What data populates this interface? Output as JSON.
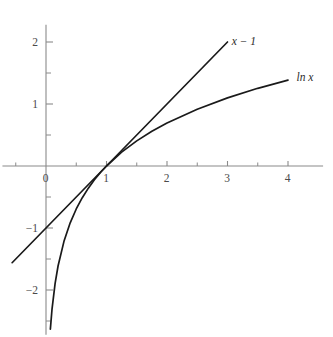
{
  "chart_data": {
    "type": "line",
    "title": "",
    "subtitle": "",
    "xlabel": "",
    "ylabel": "",
    "xlim": [
      -0.75,
      4.6
    ],
    "ylim": [
      -2.7,
      2.35
    ],
    "grid": false,
    "legend_position": "inline-curve-end-labels",
    "x_ticks_major": [
      0,
      1,
      2,
      3,
      4
    ],
    "x_tick_labels": [
      "0",
      "1",
      "2",
      "3",
      "4"
    ],
    "x_ticks_minor": [
      -0.5,
      0.5,
      1.5,
      2.5,
      3.5
    ],
    "y_ticks_major": [
      -2,
      -1,
      1,
      2
    ],
    "y_tick_labels": [
      "−2",
      "−1",
      "1",
      "2"
    ],
    "y_ticks_minor": [
      -2.5,
      -1.5,
      -0.5,
      0.5,
      1.5
    ],
    "annotations": [
      {
        "text": "x − 1",
        "x": 3.07,
        "y": 2.02
      },
      {
        "text": "ln x",
        "x": 4.14,
        "y": 1.43
      }
    ],
    "series": [
      {
        "name": "x − 1",
        "label": "x − 1",
        "type": "line",
        "color": "#1a1a1a",
        "x_start": -0.56,
        "x_end": 3.0,
        "points": [
          {
            "x": -0.56,
            "y": -1.56
          },
          {
            "x": 0.0,
            "y": -1.0
          },
          {
            "x": 1.0,
            "y": 0.0
          },
          {
            "x": 2.0,
            "y": 1.0
          },
          {
            "x": 3.0,
            "y": 2.0
          }
        ]
      },
      {
        "name": "ln x",
        "label": "ln x",
        "type": "curve",
        "color": "#1a1a1a",
        "x_start": 0.072,
        "x_end": 4.0,
        "points": [
          {
            "x": 0.072,
            "y": -2.63
          },
          {
            "x": 0.1,
            "y": -2.303
          },
          {
            "x": 0.15,
            "y": -1.897
          },
          {
            "x": 0.2,
            "y": -1.609
          },
          {
            "x": 0.3,
            "y": -1.204
          },
          {
            "x": 0.4,
            "y": -0.916
          },
          {
            "x": 0.5,
            "y": -0.693
          },
          {
            "x": 0.6,
            "y": -0.511
          },
          {
            "x": 0.7,
            "y": -0.357
          },
          {
            "x": 0.8,
            "y": -0.223
          },
          {
            "x": 0.9,
            "y": -0.105
          },
          {
            "x": 1.0,
            "y": 0.0
          },
          {
            "x": 1.25,
            "y": 0.223
          },
          {
            "x": 1.5,
            "y": 0.405
          },
          {
            "x": 1.75,
            "y": 0.56
          },
          {
            "x": 2.0,
            "y": 0.693
          },
          {
            "x": 2.5,
            "y": 0.916
          },
          {
            "x": 3.0,
            "y": 1.099
          },
          {
            "x": 3.5,
            "y": 1.253
          },
          {
            "x": 4.0,
            "y": 1.386
          }
        ]
      }
    ],
    "axes": {
      "x_axis_y_value": 0,
      "y_axis_x_value": 0,
      "x_axis_range": [
        -0.72,
        4.58
      ],
      "y_axis_range": [
        -2.72,
        2.28
      ],
      "color": "#8a8a8a"
    }
  }
}
